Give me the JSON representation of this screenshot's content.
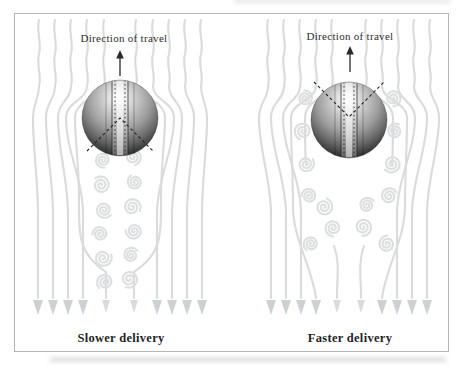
{
  "figure": {
    "panels": [
      {
        "id": "slower",
        "direction_label": "Direction of travel",
        "caption": "Slower delivery"
      },
      {
        "id": "faster",
        "direction_label": "Direction of travel",
        "caption": "Faster delivery"
      }
    ],
    "icons": {
      "travel_arrow": "upward solid arrow",
      "vortex": "spiral stroke glyph",
      "flow_arrowhead": "downward triangle"
    },
    "colors": {
      "streamline": "#d9dbdc",
      "vortex": "#dcdedf",
      "arrowhead": "#ced1d3",
      "text": "#2e2e2e",
      "caption_text": "#1f1f1f",
      "frame_border": "#b5b5b5",
      "background": "#ffffff",
      "travel_arrow": "#2a2a2a",
      "separation_dash": "#242424"
    }
  }
}
